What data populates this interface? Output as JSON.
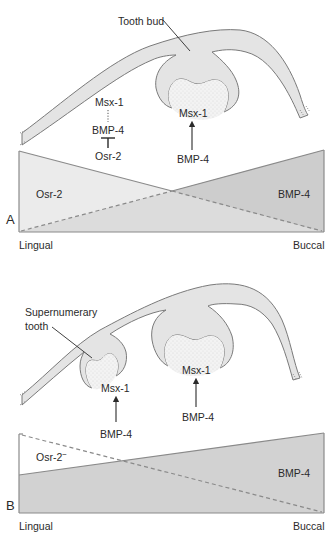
{
  "figure": {
    "panels": [
      {
        "id": "A",
        "panel_label": "A",
        "callout": "Tooth bud",
        "pathway": {
          "top": "Msx-1",
          "middle": "BMP-4",
          "bottom": "Osr-2",
          "top_to_middle_link": "dotted",
          "bottom_to_middle_link": "inhibition"
        },
        "bud_label": "Msx-1",
        "bud_signal": "BMP-4",
        "gradient": {
          "left_label": "Osr-2",
          "right_label": "BMP-4",
          "axis_left": "Lingual",
          "axis_right": "Buccal"
        }
      },
      {
        "id": "B",
        "panel_label": "B",
        "callout": "Supernumerary tooth",
        "callout_line1": "Supernumerary",
        "callout_line2": "tooth",
        "super_bud_label": "Msx-1",
        "super_bud_signal": "BMP-4",
        "bud_label": "Msx-1",
        "bud_signal": "BMP-4",
        "gradient": {
          "left_label": "Osr-2",
          "left_label_superscript": "−",
          "right_label": "BMP-4",
          "axis_left": "Lingual",
          "axis_right": "Buccal"
        }
      }
    ],
    "colors": {
      "epithelium_fill": "#e4e4e4",
      "outline": "#7a7a7a",
      "gradient_light": "#e9e9e9",
      "gradient_dark": "#cfcfcf",
      "text": "#2a2a2a"
    }
  }
}
